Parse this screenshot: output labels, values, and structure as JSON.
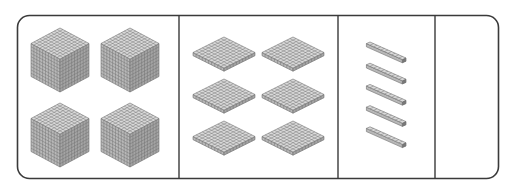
{
  "colors": {
    "border": "#3a3a3a",
    "block_top": "#d9d9d9",
    "block_left": "#b8b8b8",
    "block_right": "#a4a4a4",
    "grid_line": "#6e6e6e"
  },
  "columns": [
    {
      "place": "thousands",
      "block": "cube",
      "count": 4
    },
    {
      "place": "hundreds",
      "block": "flat",
      "count": 6
    },
    {
      "place": "tens",
      "block": "rod",
      "count": 5
    },
    {
      "place": "ones",
      "block": "unit",
      "count": 0
    }
  ],
  "represented_value": 4650
}
